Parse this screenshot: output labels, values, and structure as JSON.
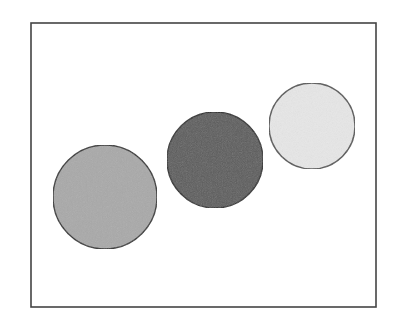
{
  "figure": {
    "width": 400,
    "height": 321,
    "background": "#ffffff",
    "frame": {
      "x": 31,
      "y": 23,
      "width": 345,
      "height": 284,
      "stroke": "#444444",
      "stroke_width": 1.6
    },
    "circles": [
      {
        "name": "left-circle",
        "cx": 105,
        "cy": 197,
        "r": 52,
        "fill": "#a9a9a9",
        "stroke": "#2e2e2e"
      },
      {
        "name": "middle-circle",
        "cx": 215,
        "cy": 160,
        "r": 48,
        "fill": "#5b5b5b",
        "stroke": "#262626"
      },
      {
        "name": "right-circle",
        "cx": 312,
        "cy": 126,
        "r": 43,
        "fill": "#e7e7e7",
        "stroke": "#555555"
      }
    ]
  }
}
